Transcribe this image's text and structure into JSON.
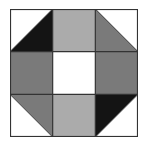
{
  "diagram": {
    "type": "quilt-block",
    "grid": {
      "rows": 3,
      "cols": 3
    },
    "colors": {
      "black": "#141414",
      "dark_gray": "#7a7a7a",
      "light_gray": "#ababab",
      "white": "#ffffff",
      "line": "#333333"
    },
    "cells": [
      {
        "row": 0,
        "col": 0,
        "kind": "half-triangle",
        "diagonal": "bl-tr",
        "upper": "white",
        "lower": "black"
      },
      {
        "row": 0,
        "col": 1,
        "kind": "solid",
        "fill": "light_gray"
      },
      {
        "row": 0,
        "col": 2,
        "kind": "half-triangle",
        "diagonal": "tl-br",
        "upper": "white",
        "lower": "dark_gray"
      },
      {
        "row": 1,
        "col": 0,
        "kind": "solid",
        "fill": "dark_gray"
      },
      {
        "row": 1,
        "col": 1,
        "kind": "solid",
        "fill": "white"
      },
      {
        "row": 1,
        "col": 2,
        "kind": "solid",
        "fill": "dark_gray"
      },
      {
        "row": 2,
        "col": 0,
        "kind": "half-triangle",
        "diagonal": "tl-br",
        "upper": "dark_gray",
        "lower": "white"
      },
      {
        "row": 2,
        "col": 1,
        "kind": "solid",
        "fill": "light_gray"
      },
      {
        "row": 2,
        "col": 2,
        "kind": "half-triangle",
        "diagonal": "bl-tr",
        "upper": "black",
        "lower": "white"
      }
    ]
  }
}
